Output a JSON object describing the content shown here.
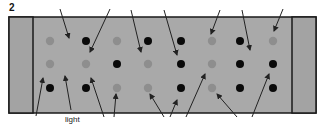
{
  "figure": {
    "number": "2",
    "labels": [
      {
        "text": "light",
        "x": 65,
        "y": 115
      }
    ]
  },
  "colors": {
    "background": "#ffffff",
    "panel": "#a9a9a9",
    "end_cap": "#a3a3a3",
    "outline": "#1a1a1a",
    "dot_dark": "#0a0a0a",
    "dot_light": "#8e8e8e",
    "arrow": "#222222"
  },
  "panel": {
    "outer": {
      "x": 9,
      "y": 17,
      "w": 149,
      "h": 0
    },
    "frame": {
      "x": 9,
      "y": 17,
      "w": 307,
      "h": 96
    },
    "left_cap_w": 24,
    "right_cap_x": 292
  },
  "dots": {
    "columns_x": [
      50,
      86,
      117,
      148,
      181,
      212,
      240,
      273
    ],
    "rows_y": [
      41,
      64,
      88
    ],
    "pattern": [
      [
        "light",
        "dark",
        "light",
        "dark",
        "dark",
        "light",
        "dark",
        "light"
      ],
      [
        "light",
        "light",
        "dark",
        "light",
        "dark",
        "light",
        "dark",
        "dark"
      ],
      [
        "dark",
        "dark",
        "light",
        "light",
        "dark",
        "light",
        "dark",
        "dark"
      ]
    ]
  },
  "arrows_top": [
    {
      "x1": 60,
      "y1": 9,
      "x2": 69,
      "y2": 38
    },
    {
      "x1": 110,
      "y1": 9,
      "x2": 90,
      "y2": 52
    },
    {
      "x1": 131,
      "y1": 10,
      "x2": 141,
      "y2": 52
    },
    {
      "x1": 164,
      "y1": 10,
      "x2": 177,
      "y2": 55
    },
    {
      "x1": 220,
      "y1": 10,
      "x2": 211,
      "y2": 34
    },
    {
      "x1": 242,
      "y1": 10,
      "x2": 250,
      "y2": 50
    },
    {
      "x1": 283,
      "y1": 9,
      "x2": 274,
      "y2": 31
    }
  ],
  "arrows_bottom": [
    {
      "x1": 36,
      "y1": 116,
      "x2": 43,
      "y2": 78
    },
    {
      "x1": 71,
      "y1": 110,
      "x2": 65,
      "y2": 76
    },
    {
      "x1": 104,
      "y1": 117,
      "x2": 91,
      "y2": 78
    },
    {
      "x1": 114,
      "y1": 117,
      "x2": 116,
      "y2": 94
    },
    {
      "x1": 164,
      "y1": 117,
      "x2": 150,
      "y2": 94
    },
    {
      "x1": 186,
      "y1": 117,
      "x2": 205,
      "y2": 74
    },
    {
      "x1": 237,
      "y1": 117,
      "x2": 217,
      "y2": 94
    },
    {
      "x1": 252,
      "y1": 117,
      "x2": 269,
      "y2": 74
    },
    {
      "x1": 170,
      "y1": 117,
      "x2": 177,
      "y2": 100
    }
  ]
}
